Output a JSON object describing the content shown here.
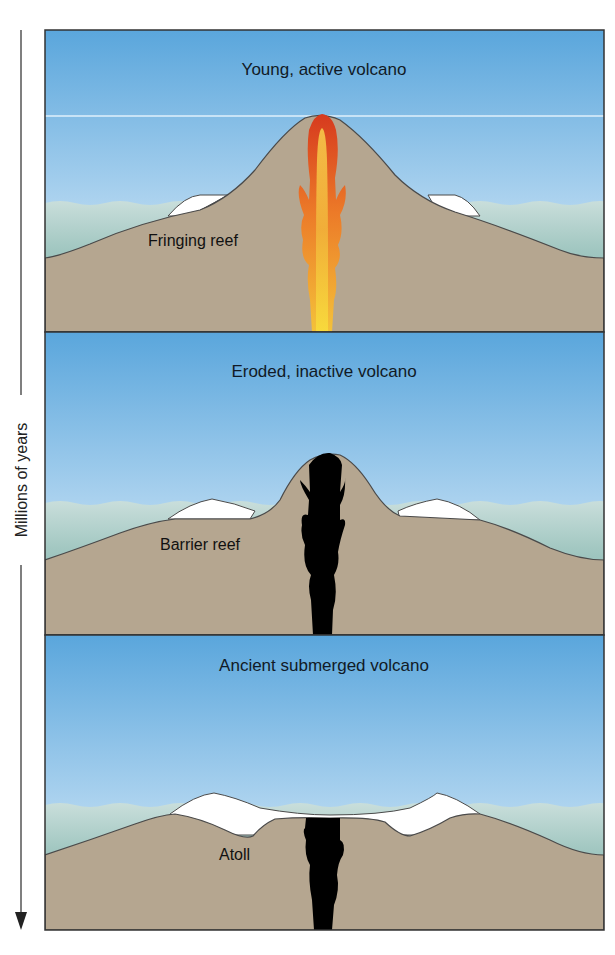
{
  "figure": {
    "time_axis": {
      "label": "Millions of years",
      "direction": "down",
      "icon": "arrow-down-icon"
    },
    "panels": [
      {
        "id": "young",
        "title": "Young, active volcano",
        "reef_label": "Fringing reef",
        "magma_state": "active",
        "colors": {
          "magma_outer": "#d8401e",
          "magma_mid": "#ee8a2a",
          "magma_inner": "#f6d040"
        }
      },
      {
        "id": "eroded",
        "title": "Eroded, inactive volcano",
        "reef_label": "Barrier reef",
        "magma_state": "inactive",
        "colors": {
          "magma": "#000000"
        }
      },
      {
        "id": "ancient",
        "title": "Ancient submerged volcano",
        "reef_label": "Atoll",
        "magma_state": "inactive",
        "colors": {
          "magma": "#000000"
        }
      }
    ],
    "colors": {
      "sky_top": "#5aa6dc",
      "sky_bottom": "#eaf4fa",
      "sea": "#8fbcb6",
      "rock": "#b5a690",
      "reef": "#ffffff",
      "outline": "#3c3c3c"
    }
  }
}
